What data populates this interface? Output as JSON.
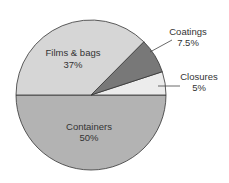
{
  "chart_data": {
    "type": "pie",
    "title": "",
    "categories": [
      "Containers",
      "Films & bags",
      "Coatings",
      "Closures"
    ],
    "values": [
      50,
      37,
      7.5,
      5
    ],
    "value_labels": [
      "50%",
      "37%",
      "7.5%",
      "5%"
    ],
    "colors": [
      "#b3b3b3",
      "#d6d6d6",
      "#787878",
      "#ececec"
    ],
    "start_angle_deg": 180,
    "direction": "counterclockwise-from-left",
    "legend": "none (direct labels)",
    "labels": {
      "containers": {
        "name": "Containers",
        "pct": "50%"
      },
      "films": {
        "name": "Films & bags",
        "pct": "37%"
      },
      "coatings": {
        "name": "Coatings",
        "pct": "7.5%"
      },
      "closures": {
        "name": "Closures",
        "pct": "5%"
      }
    }
  }
}
